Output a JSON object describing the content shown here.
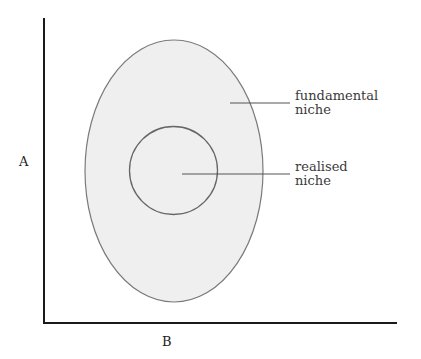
{
  "diagram": {
    "axes": {
      "y_label": "A",
      "x_label": "B"
    },
    "regions": {
      "fundamental": {
        "line1": "fundamental",
        "line2": "niche"
      },
      "realised": {
        "line1": "realised",
        "line2": "niche"
      }
    },
    "colors": {
      "axis": "#1a1a1a",
      "outline": "#777777",
      "fill": "#efefef",
      "leader": "#555555"
    }
  }
}
